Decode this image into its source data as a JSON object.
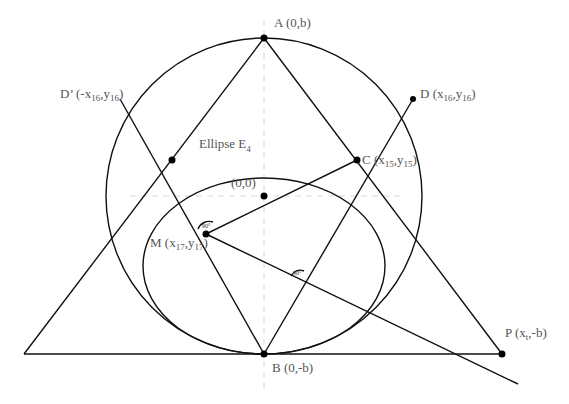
{
  "diagram": {
    "labels": {
      "A": {
        "name": "A",
        "coords": "(0,b)"
      },
      "B": {
        "name": "B",
        "coords": "(0,-b)"
      },
      "C": {
        "name": "C",
        "open": "(x",
        "sub1": "15",
        "mid": ",y",
        "sub2": "15",
        "close": ")"
      },
      "D": {
        "name": "D",
        "open": "(x",
        "sub1": "16",
        "mid": ",y",
        "sub2": "16",
        "close": ")"
      },
      "Dprime": {
        "name": "D’",
        "open": "(-x",
        "sub1": "16",
        "mid": ",y",
        "sub2": "16",
        "close": ")"
      },
      "M": {
        "name": "M",
        "open": "(x",
        "sub1": "17",
        "mid": ",y",
        "sub2": "17",
        "close": ")"
      },
      "P": {
        "name": "P",
        "open": "(x",
        "sub1": "t",
        "mid": ",-b)"
      },
      "origin": "(0,0)",
      "ellipse": {
        "name": "Ellipse E",
        "sub": "4"
      }
    },
    "angles": {
      "at_M": "90°",
      "at_intersection": "90°"
    },
    "colors": {
      "stroke": "#111111",
      "label": "#555555",
      "guide": "#d8d8d8"
    }
  }
}
